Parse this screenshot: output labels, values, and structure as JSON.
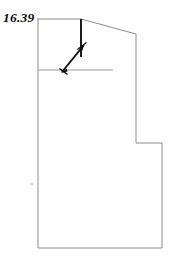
{
  "figure": {
    "label": "16.39",
    "label_position": {
      "x": 3,
      "y": 11
    },
    "width": 171,
    "height": 267,
    "background_color": "#ffffff",
    "outline_color": "#8c8c8c",
    "annotation_color": "#111111",
    "reference_line_color": "#9a9a9a",
    "dot_color": "#b5b5b5"
  },
  "chart_data": {
    "type": "line",
    "title": "16.39",
    "xlabel": "",
    "ylabel": "",
    "xlim": [
      0,
      171
    ],
    "ylim": [
      267,
      0
    ],
    "grid": false,
    "legend": null,
    "series": [
      {
        "name": "outline-polygon",
        "kind": "closed-polyline",
        "color": "#8c8c8c",
        "width": 1,
        "points": [
          [
            38,
            19
          ],
          [
            81,
            19
          ],
          [
            136,
            34
          ],
          [
            136,
            143
          ],
          [
            162,
            143
          ],
          [
            162,
            248
          ],
          [
            38,
            248
          ]
        ]
      },
      {
        "name": "vertical-dimension-arrow",
        "kind": "polyline",
        "color": "#111111",
        "width": 2,
        "points": [
          [
            81,
            19
          ],
          [
            81,
            57
          ]
        ]
      },
      {
        "name": "diagonal-dimension-arrow",
        "kind": "polyline",
        "color": "#111111",
        "width": 2,
        "points": [
          [
            62,
            72
          ],
          [
            84,
            45
          ]
        ]
      },
      {
        "name": "horizontal-reference-line",
        "kind": "polyline",
        "color": "#9a9a9a",
        "width": 1,
        "points": [
          [
            38,
            70
          ],
          [
            113,
            70
          ]
        ]
      }
    ],
    "markers": [
      {
        "name": "cross-mark-upper",
        "symbol": "x",
        "x": 82,
        "y": 46,
        "size": 9,
        "color": "#111111"
      },
      {
        "name": "cross-mark-lower",
        "symbol": "x",
        "x": 63,
        "y": 71,
        "size": 8,
        "color": "#111111"
      },
      {
        "name": "stray-dot",
        "symbol": ".",
        "x": 32,
        "y": 184,
        "size": 2,
        "color": "#b5b5b5"
      }
    ],
    "annotations": [
      {
        "text": "16.39",
        "x": 3,
        "y": 11,
        "style": "bold-italic-serif"
      }
    ]
  }
}
